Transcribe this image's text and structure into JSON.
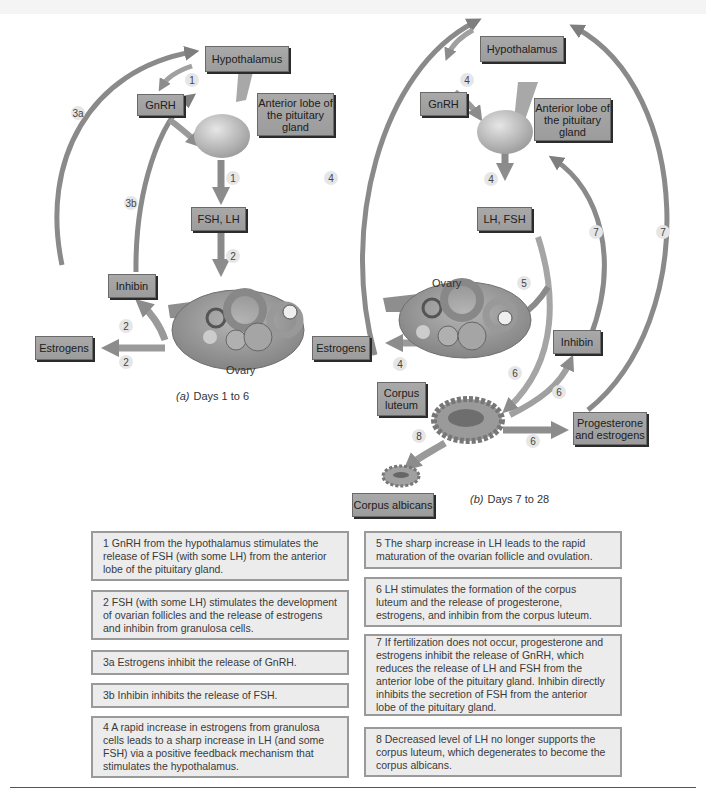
{
  "panel_a": {
    "caption_letter": "(a)",
    "caption_text": "Days 1 to 6",
    "labels": {
      "hypothalamus": "Hypothalamus",
      "gnrh": "GnRH",
      "anterior_lobe": "Anterior lobe of the pituitary gland",
      "fsh_lh": "FSH, LH",
      "inhibin": "Inhibin",
      "estrogens": "Estrogens",
      "ovary": "Ovary"
    },
    "steps": [
      "1",
      "1",
      "2",
      "2",
      "2",
      "3a",
      "3b"
    ]
  },
  "panel_b": {
    "caption_letter": "(b)",
    "caption_text": "Days 7 to 28",
    "labels": {
      "hypothalamus": "Hypothalamus",
      "gnrh": "GnRH",
      "anterior_lobe": "Anterior lobe of the pituitary gland",
      "lh_fsh": "LH, FSH",
      "ovary": "Ovary",
      "estrogens": "Estrogens",
      "inhibin": "Inhibin",
      "corpus_luteum": "Corpus luteum",
      "progesterone_estrogens": "Progesterone and estrogens",
      "corpus_albicans": "Corpus albicans"
    },
    "steps": [
      "4",
      "4",
      "4",
      "4",
      "5",
      "6",
      "6",
      "6",
      "7",
      "7",
      "8"
    ]
  },
  "notes_left": [
    "1  GnRH from the hypothalamus stimulates the release of FSH (with some LH) from the anterior lobe of the pituitary gland.",
    "2  FSH (with some LH) stimulates the development of ovarian follicles and the release of estrogens and inhibin from granulosa cells.",
    "3a Estrogens inhibit the release of GnRH.",
    "3b Inhibin inhibits the release of FSH.",
    "4  A rapid increase in estrogens from granulosa cells leads to a sharp increase in LH (and some FSH) via a positive feedback mechanism that stimulates the hypothalamus."
  ],
  "notes_right": [
    "5  The sharp increase in LH leads to the rapid maturation of the ovarian follicle and ovulation.",
    "6  LH stimulates the formation of the corpus luteum and the release of progesterone, estrogens, and inhibin from the corpus luteum.",
    "7  If fertilization does not occur, progesterone and estrogens inhibit the release of GnRH, which reduces the release of LH and FSH from the anterior lobe of the pituitary gland. Inhibin directly inhibits the secretion of FSH from the anterior lobe of the pituitary gland.",
    "8  Decreased level of LH no longer supports the corpus luteum, which degenerates to become the corpus albicans."
  ],
  "colors": {
    "label_fill": "#a3a3a3",
    "arrow": "#8a8a8a",
    "note_fill": "#ececec",
    "note_border": "#9a9a9a"
  }
}
